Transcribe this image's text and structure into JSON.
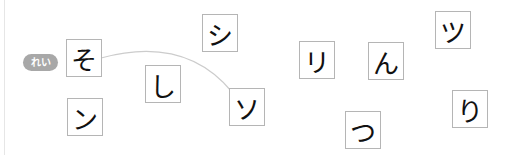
{
  "example_badge": "れい",
  "cards": [
    {
      "id": "so-hiragana",
      "char": "そ",
      "x": 66,
      "y": 39
    },
    {
      "id": "n-katakana",
      "char": "ン",
      "x": 67,
      "y": 98
    },
    {
      "id": "shi-hiragana",
      "char": "し",
      "x": 145,
      "y": 65
    },
    {
      "id": "shi-katakana",
      "char": "シ",
      "x": 202,
      "y": 14
    },
    {
      "id": "so-katakana",
      "char": "ソ",
      "x": 229,
      "y": 88
    },
    {
      "id": "ri-katakana",
      "char": "リ",
      "x": 299,
      "y": 41
    },
    {
      "id": "n-hiragana",
      "char": "ん",
      "x": 368,
      "y": 42
    },
    {
      "id": "tsu-katakana",
      "char": "ツ",
      "x": 435,
      "y": 11
    },
    {
      "id": "tsu-hiragana",
      "char": "つ",
      "x": 345,
      "y": 111
    },
    {
      "id": "ri-hiragana",
      "char": "り",
      "x": 452,
      "y": 90
    }
  ],
  "example_connection": {
    "from": "そ",
    "to": "ソ",
    "color": "#cccccc"
  }
}
